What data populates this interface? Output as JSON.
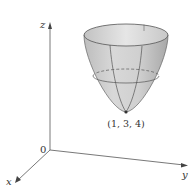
{
  "diagram": {
    "type": "3d-surface-plot",
    "surface": "elliptic paraboloid (opening upward)",
    "axes": {
      "x_label": "x",
      "y_label": "y",
      "z_label": "z",
      "origin_label": "0"
    },
    "vertex_label": "(1, 3, 4)",
    "colors": {
      "surface_fill": "#c8c8c8",
      "surface_stroke": "#555555",
      "axis": "#555555",
      "background": "#ffffff"
    }
  }
}
